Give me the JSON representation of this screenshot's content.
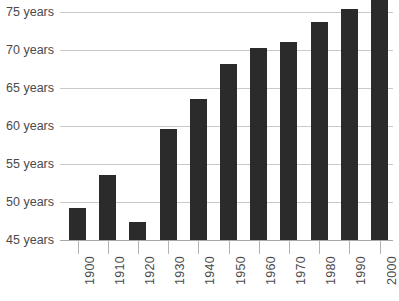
{
  "chart_data": {
    "type": "bar",
    "title": "",
    "subtitle": "",
    "xlabel": "",
    "ylabel": "",
    "categories": [
      "1900",
      "1910",
      "1920",
      "1930",
      "1940",
      "1950",
      "1960",
      "1970",
      "1980",
      "1990",
      "2000"
    ],
    "values": [
      49.2,
      53.5,
      47.4,
      59.6,
      63.5,
      68.2,
      70.3,
      71.0,
      73.7,
      75.4,
      77.0
    ],
    "ylim": [
      45,
      77.5
    ],
    "ytick_values": [
      45,
      50,
      55,
      60,
      65,
      70,
      75
    ],
    "ytick_labels": [
      "45 years",
      "50 years",
      "55 years",
      "60 years",
      "65 years",
      "70 years",
      "75 years"
    ],
    "grid": true,
    "legend": false,
    "legend_position": "none",
    "bar_color": "#2b2b2b",
    "gridline_color": "#c9c9c9",
    "axis_color": "#a8a8a8",
    "label_color": "#4a4a4a",
    "background_color": "#ffffff"
  }
}
